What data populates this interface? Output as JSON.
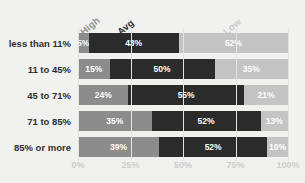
{
  "chart_data": {
    "type": "bar",
    "subtype": "stacked-horizontal-100pct",
    "title": "",
    "xlabel": "",
    "ylabel": "",
    "xlim": [
      0,
      100
    ],
    "grid": true,
    "legend_position": "top-rotated",
    "categories": [
      "less than 11%",
      "11 to 45%",
      "45 to 71%",
      "71 to 85%",
      "85% or more"
    ],
    "series": [
      {
        "name": "High",
        "color": "#8c8c8c",
        "values": [
          5,
          15,
          24,
          35,
          39
        ]
      },
      {
        "name": "Avg",
        "color": "#2b2b2b",
        "values": [
          43,
          50,
          55,
          52,
          52
        ]
      },
      {
        "name": "Low",
        "color": "#c4c4c4",
        "values": [
          52,
          35,
          21,
          13,
          10
        ]
      }
    ],
    "value_labels": [
      [
        "5%",
        "43%",
        "52%"
      ],
      [
        "15%",
        "50%",
        "35%"
      ],
      [
        "24%",
        "55%",
        "21%"
      ],
      [
        "35%",
        "52%",
        "13%"
      ],
      [
        "39%",
        "52%",
        "10%"
      ]
    ],
    "xticks": [
      {
        "value": 0,
        "label": "0%"
      },
      {
        "value": 25,
        "label": "25%"
      },
      {
        "value": 50,
        "label": "50%"
      },
      {
        "value": 75,
        "label": "75%"
      },
      {
        "value": 100,
        "label": "100%"
      }
    ],
    "colors": {
      "background": "#f1f1ef",
      "high": "#8c8c8c",
      "avg": "#2b2b2b",
      "low": "#c4c4c4",
      "gridline": "#e2e2e0",
      "tick_label": "#cdcdcb",
      "category_label": "#2f2f2f",
      "value_label": "#ffffff"
    }
  }
}
